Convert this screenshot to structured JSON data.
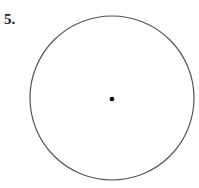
{
  "problem": {
    "number_label": "5."
  },
  "figure": {
    "shape": "circle",
    "center": {
      "x": 112,
      "y": 98
    },
    "radius": 83,
    "stroke_color": "#555555",
    "center_dot_color": "#000000"
  }
}
